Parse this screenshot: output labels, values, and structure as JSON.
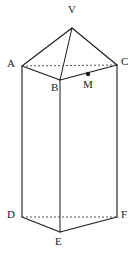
{
  "figure": {
    "type": "geometry-diagram",
    "stroke_color": "#1a1a1a",
    "dashed_color": "#555555",
    "background_color": "#ffffff",
    "stroke_width": 1,
    "labels": {
      "apex": "V",
      "top_left": "A",
      "top_front": "B",
      "top_right": "C",
      "midpoint": "M",
      "bottom_left": "D",
      "bottom_front": "E",
      "bottom_right": "F"
    },
    "points": {
      "V": {
        "x": 72,
        "y": 28,
        "label": "V",
        "label_x": 68,
        "label_y": 9
      },
      "A": {
        "x": 22,
        "y": 66,
        "label": "A",
        "label_x": 8,
        "label_y": 62
      },
      "B": {
        "x": 60,
        "y": 80,
        "label": "B",
        "label_x": 52,
        "label_y": 85
      },
      "C": {
        "x": 117,
        "y": 65,
        "label": "C",
        "label_x": 121,
        "label_y": 60
      },
      "M": {
        "x": 88,
        "y": 74,
        "label": "M",
        "label_x": 84,
        "label_y": 82
      },
      "D": {
        "x": 22,
        "y": 217,
        "label": "D",
        "label_x": 8,
        "label_y": 212
      },
      "E": {
        "x": 60,
        "y": 232,
        "label": "E",
        "label_x": 55,
        "label_y": 238
      },
      "F": {
        "x": 117,
        "y": 217,
        "label": "F",
        "label_x": 121,
        "label_y": 212
      }
    },
    "solid_edges": [
      {
        "name": "V-A",
        "from": "V",
        "to": "A"
      },
      {
        "name": "V-C",
        "from": "V",
        "to": "C"
      },
      {
        "name": "V-B",
        "from": "V",
        "to": "B"
      },
      {
        "name": "A-B",
        "from": "A",
        "to": "B"
      },
      {
        "name": "B-C",
        "from": "B",
        "to": "C"
      },
      {
        "name": "A-D",
        "from": "A",
        "to": "D"
      },
      {
        "name": "B-E",
        "from": "B",
        "to": "E"
      },
      {
        "name": "C-F",
        "from": "C",
        "to": "F"
      },
      {
        "name": "D-E",
        "from": "D",
        "to": "E"
      },
      {
        "name": "E-F",
        "from": "E",
        "to": "F"
      }
    ],
    "dashed_edges": [
      {
        "name": "A-C",
        "from": "A",
        "to": "C"
      },
      {
        "name": "D-F",
        "from": "D",
        "to": "F"
      }
    ],
    "marked_points": [
      {
        "name": "M",
        "at": "M",
        "radius": 2.2
      }
    ]
  }
}
